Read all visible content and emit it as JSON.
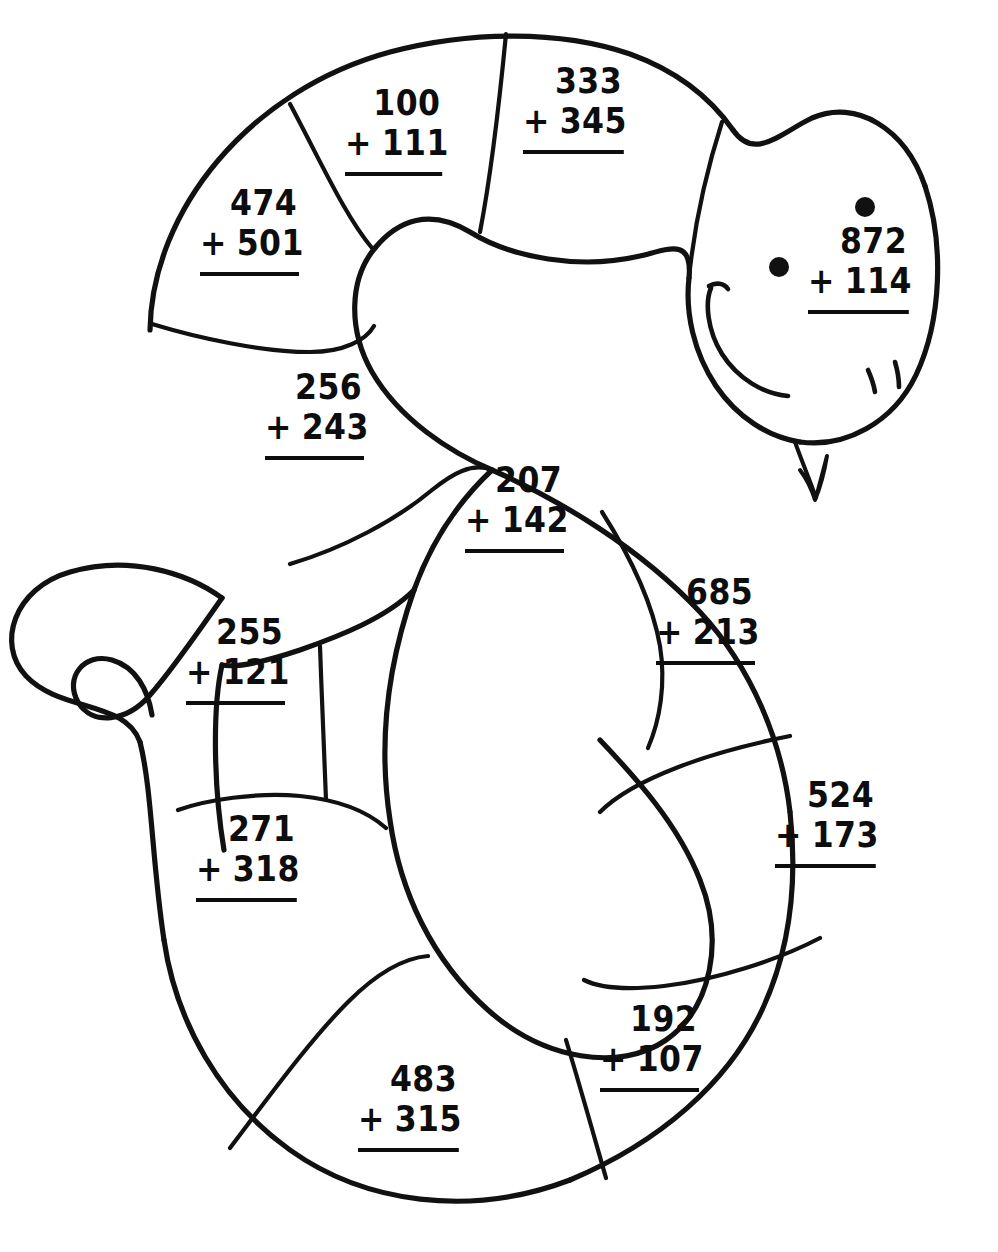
{
  "worksheet": {
    "title": "Snake Addition Coloring Worksheet",
    "subject": "three-digit addition without regrouping",
    "figure": "snake",
    "background_color": "#ffffff",
    "ink_color": "#111111",
    "problem_count": 12
  },
  "snake": {
    "head": {
      "eye_left": "eye-dot",
      "eye_right": "eye-dot",
      "mouth": "smile-curve",
      "nostrils": "two-tick-marks",
      "tongue": "forked-tongue"
    },
    "tail": "curled-tail"
  },
  "problems": [
    {
      "id": "p1",
      "addend1": "100",
      "addend2": "111",
      "operator": "+",
      "x": 345,
      "y": 84,
      "width": 108,
      "segment": "upper-back-1"
    },
    {
      "id": "p2",
      "addend1": "333",
      "addend2": "345",
      "operator": "+",
      "x": 523,
      "y": 62,
      "width": 112,
      "segment": "upper-back-2"
    },
    {
      "id": "p3",
      "addend1": "872",
      "addend2": "114",
      "operator": "+",
      "x": 808,
      "y": 222,
      "width": 112,
      "segment": "head"
    },
    {
      "id": "p4",
      "addend1": "474",
      "addend2": "501",
      "operator": "+",
      "x": 200,
      "y": 184,
      "width": 110,
      "segment": "upper-left-coil"
    },
    {
      "id": "p5",
      "addend1": "256",
      "addend2": "243",
      "operator": "+",
      "x": 265,
      "y": 368,
      "width": 110,
      "segment": "mid-left-coil"
    },
    {
      "id": "p6",
      "addend1": "207",
      "addend2": "142",
      "operator": "+",
      "x": 465,
      "y": 461,
      "width": 110,
      "segment": "mid-body"
    },
    {
      "id": "p7",
      "addend1": "685",
      "addend2": "213",
      "operator": "+",
      "x": 656,
      "y": 573,
      "width": 110,
      "segment": "right-upper"
    },
    {
      "id": "p8",
      "addend1": "524",
      "addend2": "173",
      "operator": "+",
      "x": 775,
      "y": 776,
      "width": 112,
      "segment": "right-mid"
    },
    {
      "id": "p9",
      "addend1": "255",
      "addend2": "121",
      "operator": "+",
      "x": 186,
      "y": 613,
      "width": 110,
      "segment": "tail-upper"
    },
    {
      "id": "p10",
      "addend1": "271",
      "addend2": "318",
      "operator": "+",
      "x": 196,
      "y": 810,
      "width": 112,
      "segment": "tail-lower"
    },
    {
      "id": "p11",
      "addend1": "192",
      "addend2": "107",
      "operator": "+",
      "x": 600,
      "y": 1000,
      "width": 110,
      "segment": "lower-right"
    },
    {
      "id": "p12",
      "addend1": "483",
      "addend2": "315",
      "operator": "+",
      "x": 358,
      "y": 1060,
      "width": 112,
      "segment": "lower-mid"
    }
  ]
}
